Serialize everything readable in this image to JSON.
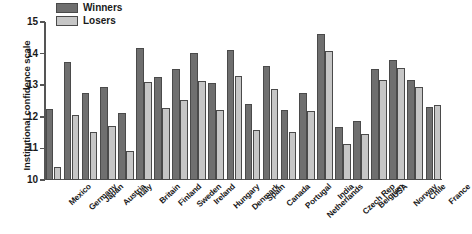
{
  "chart_data": {
    "type": "bar",
    "title": "",
    "subtitle": "",
    "xlabel": "",
    "ylabel": "Institutional confidence scale",
    "ylim": [
      10,
      15
    ],
    "yticks": [
      10,
      11,
      12,
      13,
      14,
      15
    ],
    "ytick_labels": [
      "10",
      "11",
      "12",
      "13",
      "14",
      "15"
    ],
    "grid": false,
    "legend_position": "top-left-inside",
    "categories": [
      "Mexico",
      "Germany",
      "Japan",
      "Austria",
      "Italy",
      "Britain",
      "Finland",
      "Sweden",
      "Ireland",
      "Hungary",
      "Denmark",
      "Spain",
      "Canada",
      "Portugal",
      "Netherlands",
      "India",
      "Czech Rep",
      "Belgium",
      "USA",
      "Norway",
      "Chile",
      "France"
    ],
    "series": [
      {
        "name": "Winners",
        "color": "#6f6f6f",
        "values": [
          12.26,
          13.72,
          12.74,
          12.93,
          12.11,
          14.18,
          13.25,
          13.5,
          14.02,
          13.08,
          14.1,
          12.39,
          13.61,
          12.21,
          12.75,
          14.62,
          11.69,
          11.86,
          13.52,
          13.79,
          13.17,
          12.32
        ]
      },
      {
        "name": "Losers",
        "color": "#c6c6c6",
        "values": [
          10.41,
          12.07,
          11.51,
          11.71,
          10.93,
          13.1,
          12.28,
          12.52,
          13.12,
          12.22,
          13.3,
          11.58,
          12.89,
          11.53,
          12.17,
          14.08,
          11.15,
          11.47,
          13.18,
          13.54,
          12.95,
          12.38
        ]
      }
    ]
  },
  "legend": {
    "items": [
      {
        "label": "Winners",
        "key": "winners"
      },
      {
        "label": "Losers",
        "key": "losers"
      }
    ]
  }
}
